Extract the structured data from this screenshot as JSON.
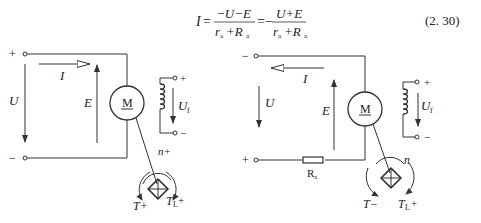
{
  "equation": {
    "lhs": "I",
    "eq1": "=",
    "frac1_num": "−U−E",
    "frac1_den_r": "r",
    "frac1_den_r_sub": "a",
    "frac1_den_plus": "+R",
    "frac1_den_R_sub": "a",
    "eq2": "=−",
    "frac2_num": "U+E",
    "frac2_den_r": "r",
    "frac2_den_r_sub": "a",
    "frac2_den_plus": "+R",
    "frac2_den_R_sub": "a",
    "number": "(2. 30)"
  },
  "left_circuit": {
    "terminal_top_sign": "+",
    "terminal_bottom_sign": "−",
    "current_label": "I",
    "voltage_label": "U",
    "emf_label": "E",
    "motor_label": "M",
    "field_plus": "+",
    "field_minus": "−",
    "field_voltage_label": "U",
    "field_voltage_sub": "f",
    "speed_label": "n+",
    "torque_label": "T+",
    "load_torque_label": "T",
    "load_torque_sub": "L",
    "load_torque_sign": "+"
  },
  "right_circuit": {
    "terminal_top_sign": "−",
    "terminal_bottom_sign": "+",
    "current_label": "I",
    "voltage_label": "U",
    "emf_label": "E",
    "motor_label": "M",
    "field_plus": "+",
    "field_minus": "−",
    "field_voltage_label": "U",
    "field_voltage_sub": "f",
    "resistor_label": "R",
    "resistor_sub": "a",
    "speed_label": "n",
    "torque_label": "T−",
    "load_torque_label": "T",
    "load_torque_sub": "L",
    "load_torque_sign": "+"
  }
}
